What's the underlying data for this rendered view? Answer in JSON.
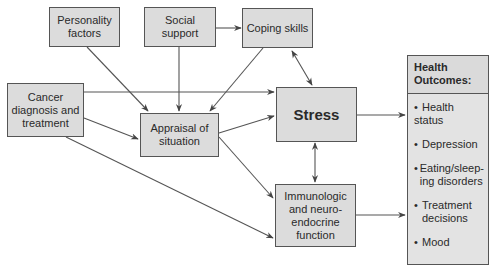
{
  "diagram": {
    "nodes": {
      "personality": {
        "label": "Personality factors"
      },
      "social": {
        "label": "Social support"
      },
      "coping": {
        "label": "Coping skills"
      },
      "cancer": {
        "label": "Cancer diagnosis and treatment"
      },
      "appraisal": {
        "label": "Appraisal of situation"
      },
      "stress": {
        "label": "Stress"
      },
      "immuno": {
        "label": "Immunologic and neuro-endocrine function"
      }
    },
    "health_outcomes": {
      "title": "Health Outcomes:",
      "bullet": "•",
      "items": [
        {
          "label": "Health status"
        },
        {
          "label": "Depression"
        },
        {
          "label": "Eating/sleep-ing disorders"
        },
        {
          "label": "Treatment decisions"
        },
        {
          "label": "Mood"
        }
      ]
    },
    "edges": [
      {
        "from": "social",
        "to": "coping",
        "type": "arrow"
      },
      {
        "from": "personality",
        "to": "appraisal",
        "type": "arrow"
      },
      {
        "from": "social",
        "to": "appraisal",
        "type": "arrow"
      },
      {
        "from": "coping",
        "to": "appraisal",
        "type": "arrow"
      },
      {
        "from": "coping",
        "to": "stress",
        "type": "bidirectional"
      },
      {
        "from": "cancer",
        "to": "stress",
        "type": "arrow"
      },
      {
        "from": "cancer",
        "to": "appraisal",
        "type": "arrow"
      },
      {
        "from": "cancer",
        "to": "immuno",
        "type": "arrow"
      },
      {
        "from": "appraisal",
        "to": "stress",
        "type": "arrow"
      },
      {
        "from": "appraisal",
        "to": "immuno",
        "type": "arrow"
      },
      {
        "from": "stress",
        "to": "immuno",
        "type": "bidirectional"
      },
      {
        "from": "stress",
        "to": "health_outcomes",
        "type": "arrow"
      },
      {
        "from": "immuno",
        "to": "health_outcomes",
        "type": "arrow"
      }
    ],
    "colors": {
      "box_fill": "#dcdcdc",
      "border": "#555555",
      "line": "#555555",
      "background": "#ffffff"
    }
  }
}
